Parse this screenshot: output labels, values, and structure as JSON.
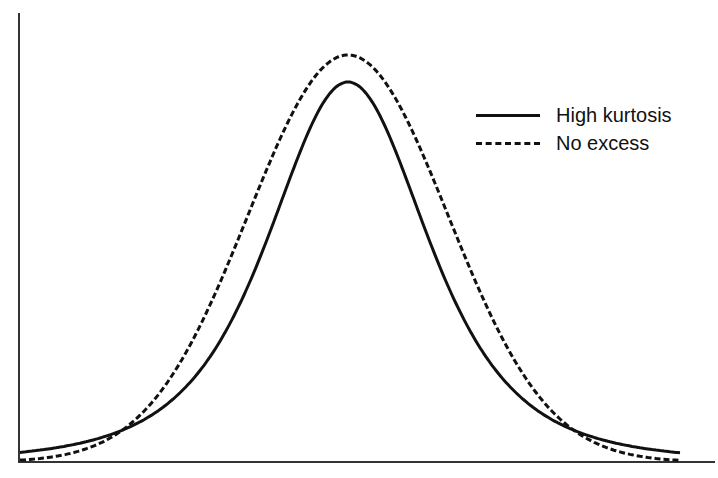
{
  "chart_data": {
    "type": "line",
    "title": "",
    "xlabel": "",
    "ylabel": "",
    "grid": false,
    "legend_position": "upper right",
    "axes": {
      "x_ticks": [],
      "y_ticks": []
    },
    "series": [
      {
        "name": "High kurtosis",
        "style": "solid",
        "color": "#111111",
        "peak_height_relative": 0.87,
        "description": "Leptokurtic curve: lower peak here, fatter tails, remains above dashed curve in tails"
      },
      {
        "name": "No excess",
        "style": "dashed",
        "color": "#111111",
        "peak_height_relative": 0.94,
        "description": "Normal (mesokurtic) curve, tails approach zero at edges"
      }
    ],
    "annotations": [
      "Curves intersect at approximately symmetric points left and right of center"
    ]
  },
  "legend": {
    "items": [
      {
        "label": "High kurtosis",
        "style": "solid"
      },
      {
        "label": "No excess",
        "style": "dashed"
      }
    ]
  }
}
